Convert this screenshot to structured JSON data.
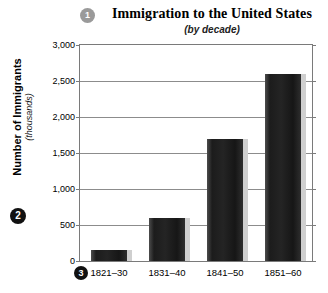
{
  "badges": {
    "title_badge": "1",
    "yaxis_badge": "2",
    "xaxis_badge": "3"
  },
  "chart_data": {
    "type": "bar",
    "title": "Immigration to the United States",
    "subtitle": "(by decade)",
    "xlabel": "",
    "ylabel": "Number of Immigrants",
    "yunits": "(thousands)",
    "categories": [
      "1821–30",
      "1831–40",
      "1841–50",
      "1851–60"
    ],
    "values": [
      150,
      600,
      1700,
      2600
    ],
    "ylim": [
      0,
      3000
    ],
    "ytick_labels": [
      "0",
      "500",
      "1,000",
      "1,500",
      "2,000",
      "2,500",
      "3,000"
    ],
    "ytick_values": [
      0,
      500,
      1000,
      1500,
      2000,
      2500,
      3000
    ],
    "grid": true,
    "legend": false,
    "bar_color": "#1c1c1c",
    "shadow_color": "#cfcfcf",
    "frame_color": "#7a7a7a"
  }
}
